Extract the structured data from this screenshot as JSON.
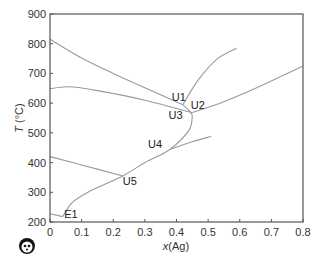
{
  "chart_data": {
    "type": "line",
    "title": "",
    "xlabel": "x(Ag)",
    "ylabel": "T (°C)",
    "xlim": [
      0,
      0.8
    ],
    "ylim": [
      200,
      900
    ],
    "x_ticks": [
      "0",
      "0.1",
      "0.2",
      "0.3",
      "0.4",
      "0.5",
      "0.6",
      "0.7",
      "0.8"
    ],
    "y_ticks": [
      "200",
      "300",
      "400",
      "500",
      "600",
      "700",
      "800",
      "900"
    ],
    "grid": false,
    "legend": null,
    "series": [
      {
        "name": "upper liquidus to U1",
        "points": [
          [
            0,
            815
          ],
          [
            0.1,
            752
          ],
          [
            0.2,
            700
          ],
          [
            0.3,
            652
          ],
          [
            0.42,
            595
          ]
        ]
      },
      {
        "name": "U1 to max",
        "points": [
          [
            0.42,
            595
          ],
          [
            0.47,
            680
          ],
          [
            0.53,
            750
          ],
          [
            0.59,
            785
          ]
        ]
      },
      {
        "name": "second liquidus to U2",
        "points": [
          [
            0,
            648
          ],
          [
            0.06,
            655
          ],
          [
            0.15,
            642
          ],
          [
            0.3,
            610
          ],
          [
            0.45,
            568
          ]
        ]
      },
      {
        "name": "U2 to right",
        "points": [
          [
            0.45,
            568
          ],
          [
            0.55,
            605
          ],
          [
            0.65,
            650
          ],
          [
            0.8,
            725
          ]
        ]
      },
      {
        "name": "U1 to U3",
        "points": [
          [
            0.42,
            595
          ],
          [
            0.44,
            575
          ],
          [
            0.45,
            560
          ]
        ]
      },
      {
        "name": "U3 to E1 valley",
        "points": [
          [
            0.45,
            560
          ],
          [
            0.44,
            510
          ],
          [
            0.38,
            445
          ],
          [
            0.3,
            400
          ],
          [
            0.23,
            355
          ],
          [
            0.12,
            300
          ],
          [
            0.07,
            265
          ],
          [
            0.04,
            218
          ]
        ]
      },
      {
        "name": "U4 to right",
        "points": [
          [
            0.38,
            445
          ],
          [
            0.45,
            470
          ],
          [
            0.51,
            488
          ]
        ]
      },
      {
        "name": "left to U5",
        "points": [
          [
            0,
            420
          ],
          [
            0.1,
            392
          ],
          [
            0.23,
            355
          ]
        ]
      },
      {
        "name": "left to E1",
        "points": [
          [
            0,
            228
          ],
          [
            0.04,
            218
          ]
        ]
      }
    ],
    "annotations": [
      {
        "text": "U1",
        "x": 0.385,
        "y": 608
      },
      {
        "text": "U2",
        "x": 0.445,
        "y": 580
      },
      {
        "text": "U3",
        "x": 0.375,
        "y": 545
      },
      {
        "text": "U4",
        "x": 0.31,
        "y": 448
      },
      {
        "text": "U5",
        "x": 0.23,
        "y": 325
      },
      {
        "text": "E1",
        "x": 0.045,
        "y": 212
      }
    ]
  },
  "labels": {
    "xlabel_var": "x",
    "xlabel_rest": "(Ag)",
    "ylabel_var": "T",
    "ylabel_rest": " (°C)"
  }
}
